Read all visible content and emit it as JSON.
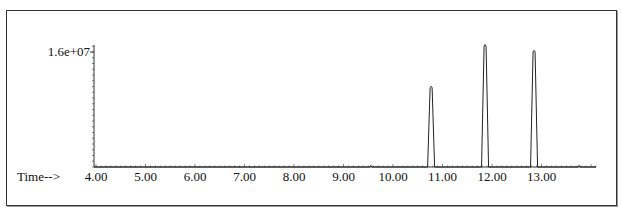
{
  "chart_data": {
    "type": "line",
    "title": "",
    "xlabel": "Time-->",
    "ylabel": "",
    "x_ticks": [
      "4.00",
      "5.00",
      "6.00",
      "7.00",
      "8.00",
      "9.00",
      "10.00",
      "11.00",
      "12.00",
      "13.00"
    ],
    "y_ticks": [
      "1.6e+07"
    ],
    "xlim": [
      4.0,
      14.0
    ],
    "ylim": [
      0,
      17500000
    ],
    "grid": false,
    "legend": null,
    "series": [
      {
        "name": "TIC",
        "peaks": [
          {
            "time": 9.55,
            "abundance": 300000
          },
          {
            "time": 10.77,
            "abundance": 11300000
          },
          {
            "time": 11.86,
            "abundance": 17100000
          },
          {
            "time": 12.85,
            "abundance": 16300000
          },
          {
            "time": 13.76,
            "abundance": 300000
          }
        ]
      }
    ]
  },
  "axis": {
    "x_label": "Time-->",
    "y_top_label": "1.6e+07"
  }
}
